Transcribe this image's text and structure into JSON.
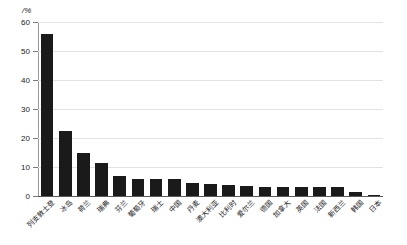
{
  "chart_data": {
    "type": "bar",
    "title": "",
    "subtitle": "",
    "xlabel": "",
    "ylabel": "/%",
    "ylim": [
      0,
      60
    ],
    "yticks": [
      0,
      10,
      20,
      30,
      40,
      50,
      60
    ],
    "ytick_labels": [
      "0",
      "10",
      "20",
      "30",
      "40",
      "50",
      "60"
    ],
    "grid": true,
    "legend": false,
    "bar_color": "#1a1a1a",
    "categories": [
      "列支敦士登",
      "冰岛",
      "荷兰",
      "瑞典",
      "芬兰",
      "葡萄牙",
      "瑞士",
      "中国",
      "丹麦",
      "澳大利亚",
      "比利时",
      "爱尔兰",
      "德国",
      "加拿大",
      "英国",
      "法国",
      "新西兰",
      "韩国",
      "日本"
    ],
    "values": [
      56.0,
      22.5,
      15.0,
      11.5,
      7.0,
      6.0,
      6.0,
      6.0,
      4.5,
      4.0,
      3.8,
      3.5,
      3.2,
      3.0,
      3.0,
      3.0,
      3.0,
      1.5,
      0.5
    ]
  },
  "axis": {
    "unit_label": "/%"
  }
}
